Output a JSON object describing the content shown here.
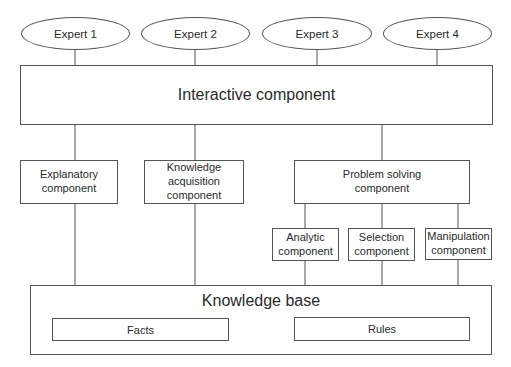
{
  "diagram": {
    "experts": [
      {
        "label": "Expert 1"
      },
      {
        "label": "Expert 2"
      },
      {
        "label": "Expert 3"
      },
      {
        "label": "Expert 4"
      }
    ],
    "interactive_component": {
      "label": "Interactive component"
    },
    "middle_components": [
      {
        "label": "Explanatory\ncomponent"
      },
      {
        "label": "Knowledge\nacquisition\ncomponent"
      },
      {
        "label": "Problem solving\ncomponent"
      }
    ],
    "problem_solving_subcomponents": [
      {
        "label": "Analytic\ncomponent"
      },
      {
        "label": "Selection\ncomponent"
      },
      {
        "label": "Manipulation\ncomponent"
      }
    ],
    "knowledge_base": {
      "label": "Knowledge base",
      "parts": [
        {
          "label": "Facts"
        },
        {
          "label": "Rules"
        }
      ]
    },
    "colors": {
      "line": "#555555",
      "text": "#2a2a2a",
      "background": "#ffffff"
    }
  }
}
